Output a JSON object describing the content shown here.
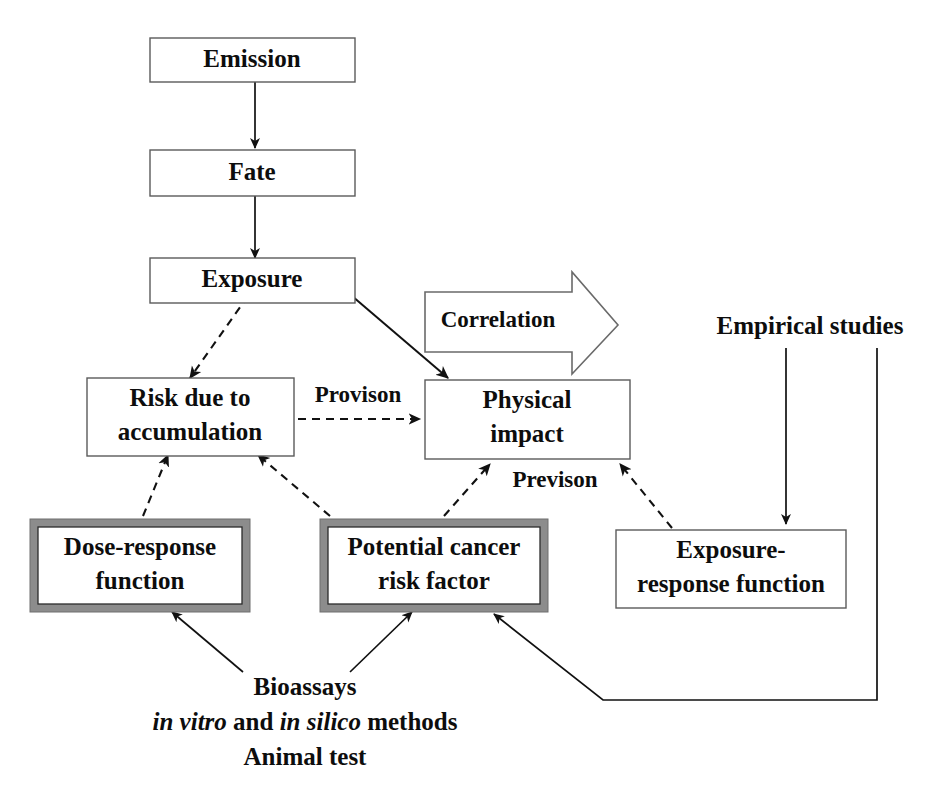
{
  "diagram": {
    "colors": {
      "background": "#ffffff",
      "box_border": "#5b5b5b",
      "highlight_border": "#8c8c8c",
      "line": "#111111",
      "text": "#0d0d0d"
    },
    "nodes": [
      {
        "id": "emission",
        "label": "Emission",
        "style": "plain"
      },
      {
        "id": "fate",
        "label": "Fate",
        "style": "plain"
      },
      {
        "id": "exposure",
        "label": "Exposure",
        "style": "plain"
      },
      {
        "id": "risk",
        "label_line1": "Risk due to",
        "label_line2": "accumulation",
        "style": "plain"
      },
      {
        "id": "physical",
        "label_line1": "Physical",
        "label_line2": "impact",
        "style": "plain"
      },
      {
        "id": "dose",
        "label_line1": "Dose-response",
        "label_line2": "function",
        "style": "highlighted"
      },
      {
        "id": "cancer",
        "label_line1": "Potential cancer",
        "label_line2": "risk factor",
        "style": "highlighted"
      },
      {
        "id": "expresp",
        "label_line1": "Exposure-",
        "label_line2": "response function",
        "style": "plain"
      }
    ],
    "edge_labels": {
      "correlation": "Correlation",
      "provison": "Provison",
      "previson": "Previson"
    },
    "free_text": {
      "empirical_studies": "Empirical studies",
      "bioassays": "Bioassays",
      "methods_in_vitro": "in vitro",
      "methods_and": " and ",
      "methods_in_silico": "in silico",
      "methods_tail": " methods",
      "animal_test": "Animal test"
    },
    "edges": [
      {
        "from": "emission",
        "to": "fate",
        "kind": "solid",
        "label": ""
      },
      {
        "from": "fate",
        "to": "exposure",
        "kind": "solid",
        "label": ""
      },
      {
        "from": "exposure",
        "to": "risk",
        "kind": "dashed",
        "label": ""
      },
      {
        "from": "exposure",
        "to": "physical",
        "kind": "solid",
        "label": ""
      },
      {
        "from": "risk",
        "to": "physical",
        "kind": "dashed",
        "label": "Provison"
      },
      {
        "from": "dose",
        "to": "risk",
        "kind": "dashed",
        "label": ""
      },
      {
        "from": "cancer",
        "to": "risk",
        "kind": "dashed",
        "label": ""
      },
      {
        "from": "cancer",
        "to": "physical",
        "kind": "dashed",
        "label": "Previson"
      },
      {
        "from": "expresp",
        "to": "physical",
        "kind": "dashed",
        "label": ""
      },
      {
        "from": "empirical_studies",
        "to": "expresp",
        "kind": "solid",
        "label": ""
      },
      {
        "from": "empirical_studies",
        "to": "cancer",
        "kind": "solid",
        "label": ""
      },
      {
        "from": "bioassays",
        "to": "dose",
        "kind": "solid",
        "label": ""
      },
      {
        "from": "bioassays",
        "to": "cancer",
        "kind": "solid",
        "label": ""
      }
    ]
  }
}
